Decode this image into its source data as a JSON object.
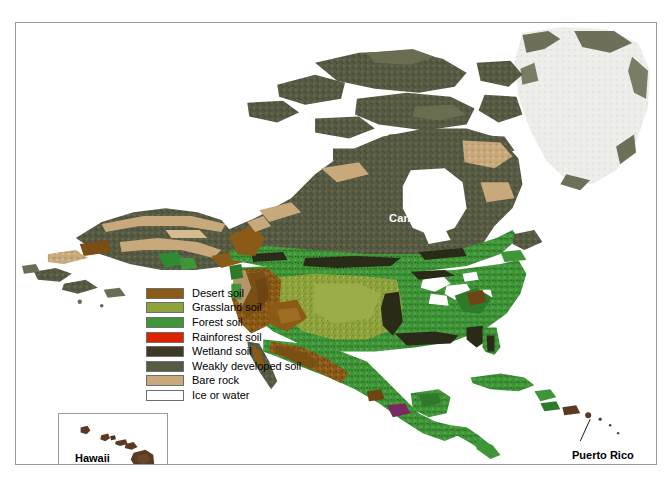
{
  "figure": {
    "background_color": "#ffffff",
    "frame_color": "#9a9a9a"
  },
  "legend": {
    "items": [
      {
        "label": "Desert soil",
        "color": "#8a5a16"
      },
      {
        "label": "Grassland soil",
        "color": "#8fa33c"
      },
      {
        "label": "Forest soil",
        "color": "#3f9638"
      },
      {
        "label": "Rainforest soil",
        "color": "#dd2200"
      },
      {
        "label": "Wetland soil",
        "color": "#3d3a26"
      },
      {
        "label": "Weakly developed soil",
        "color": "#585b43"
      },
      {
        "label": "Bare rock",
        "color": "#c7a97c"
      },
      {
        "label": "Ice or water",
        "color": "#ffffff"
      }
    ]
  },
  "map_labels": {
    "canada": "Canada",
    "united_states": "United States",
    "mexico": "Mexico",
    "puerto_rico": "Puerto Rico"
  },
  "inset": {
    "label": "Hawaii",
    "island_color": "#5a3a22"
  },
  "colors": {
    "ocean": "#ffffff",
    "ice_sheet": "#ededea",
    "weakly_developed": "#585b43",
    "bare_rock": "#c7a97c",
    "forest": "#3f9638",
    "grassland": "#8fa33c",
    "desert": "#8a5a16",
    "wetland": "#2a2a18",
    "rainforest": "#dd2200",
    "label_light": "#ffffff",
    "label_dark": "#000000"
  }
}
